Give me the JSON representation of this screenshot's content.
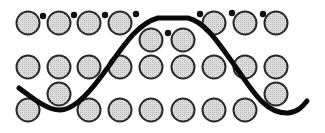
{
  "diagram": {
    "width": 325,
    "height": 133,
    "colors": {
      "background": "#ffffff",
      "circle_fill": "#d4d4d4",
      "circle_stroke": "#2a2a2a",
      "dot_fill": "#111111",
      "wave_stroke": "#0a0a0a"
    },
    "circle_radius": 11.5,
    "dot_radius": 3.2,
    "wave": {
      "stroke_width": 5,
      "path": "M19,88 C35,100 48,110 60,110 C72,110 85,98 100,78 C120,52 135,24 158,18 L188,18 C205,22 218,42 235,66 C252,90 265,114 288,113 C298,112 303,106 307,101"
    },
    "circles": [
      {
        "x": 28,
        "y": 23
      },
      {
        "x": 59,
        "y": 23
      },
      {
        "x": 89,
        "y": 23
      },
      {
        "x": 120,
        "y": 23
      },
      {
        "x": 214,
        "y": 23
      },
      {
        "x": 245,
        "y": 23
      },
      {
        "x": 276,
        "y": 23
      },
      {
        "x": 151,
        "y": 40
      },
      {
        "x": 183,
        "y": 40
      },
      {
        "x": 28,
        "y": 67
      },
      {
        "x": 59,
        "y": 67
      },
      {
        "x": 89,
        "y": 67
      },
      {
        "x": 120,
        "y": 67
      },
      {
        "x": 151,
        "y": 67
      },
      {
        "x": 183,
        "y": 67
      },
      {
        "x": 214,
        "y": 67
      },
      {
        "x": 245,
        "y": 67
      },
      {
        "x": 276,
        "y": 67
      },
      {
        "x": 59,
        "y": 94
      },
      {
        "x": 276,
        "y": 94
      },
      {
        "x": 28,
        "y": 110
      },
      {
        "x": 89,
        "y": 110
      },
      {
        "x": 120,
        "y": 110
      },
      {
        "x": 151,
        "y": 110
      },
      {
        "x": 183,
        "y": 110
      },
      {
        "x": 214,
        "y": 110
      },
      {
        "x": 245,
        "y": 110
      }
    ],
    "dots": [
      {
        "x": 43,
        "y": 16
      },
      {
        "x": 74,
        "y": 15
      },
      {
        "x": 105,
        "y": 15
      },
      {
        "x": 136,
        "y": 14
      },
      {
        "x": 200,
        "y": 14
      },
      {
        "x": 232,
        "y": 13
      },
      {
        "x": 263,
        "y": 14
      },
      {
        "x": 168,
        "y": 33
      }
    ]
  }
}
